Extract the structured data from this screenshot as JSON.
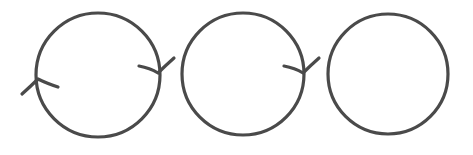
{
  "diagram": {
    "stroke_color": "#4a4a4a",
    "background": "#ffffff",
    "circles": [
      {
        "id": "circle-1",
        "cx": 98,
        "cy": 75,
        "r": 63,
        "arrows": [
          "right-clockwise",
          "left-clockwise"
        ]
      },
      {
        "id": "circle-2",
        "cx": 243,
        "cy": 74,
        "r": 61,
        "arrows": [
          "right-clockwise"
        ]
      },
      {
        "id": "circle-3",
        "cx": 388,
        "cy": 74,
        "r": 61,
        "arrows": []
      }
    ]
  }
}
